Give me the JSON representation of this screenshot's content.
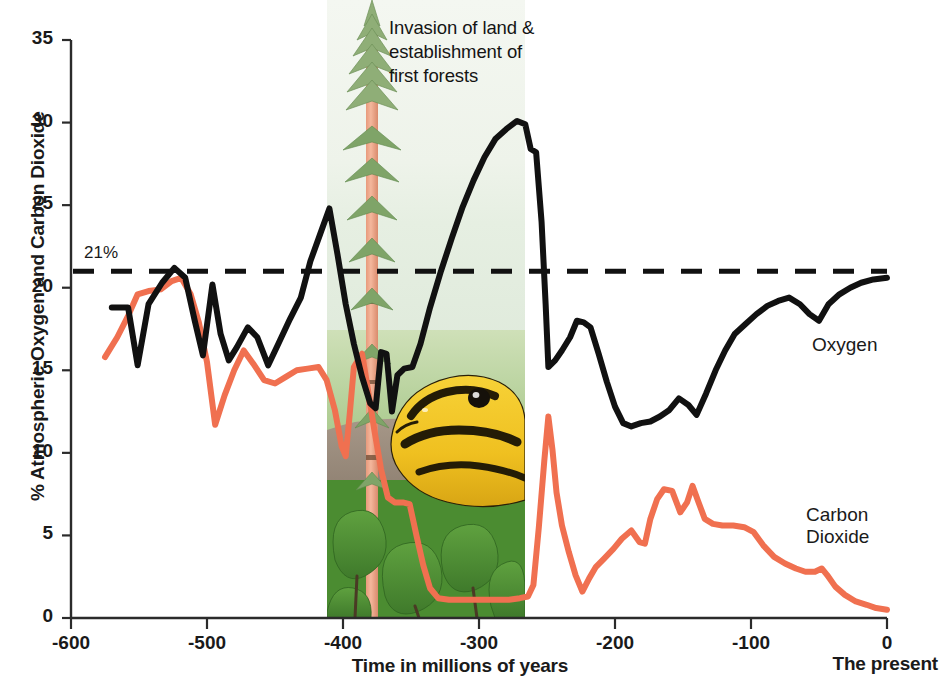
{
  "chart_data": {
    "type": "line",
    "title": "",
    "xlabel": "Time in millions of years",
    "ylabel": "% Atmospheric Oxygen and Carbon Dioxide",
    "xlim": [
      -600,
      0
    ],
    "ylim": [
      0,
      35
    ],
    "xticks": [
      -600,
      -500,
      -400,
      -300,
      -200,
      -100,
      0
    ],
    "xtick_labels": [
      "-600",
      "-500",
      "-400",
      "-300",
      "-200",
      "-100",
      "0"
    ],
    "yticks": [
      0,
      5,
      10,
      15,
      20,
      25,
      30,
      35
    ],
    "ytick_labels": [
      "0",
      "5",
      "10",
      "15",
      "20",
      "25",
      "30",
      "35"
    ],
    "grid": false,
    "legend_position": "inline-right",
    "x_axis_end_note": "The present",
    "threshold": {
      "label": "21%",
      "value": 21,
      "style": "dashed",
      "color": "#111111"
    },
    "annotations": [
      {
        "text": "Invasion of land & establishment of first forests",
        "x": -370,
        "y": 34
      }
    ],
    "series": [
      {
        "name": "Oxygen",
        "color": "#111111",
        "label": "Oxygen",
        "points": [
          [
            -570,
            18.8
          ],
          [
            -558,
            18.8
          ],
          [
            -551,
            15.3
          ],
          [
            -543,
            19.0
          ],
          [
            -533,
            20.3
          ],
          [
            -524,
            21.2
          ],
          [
            -516,
            20.6
          ],
          [
            -509,
            18.0
          ],
          [
            -503,
            15.9
          ],
          [
            -496,
            20.2
          ],
          [
            -490,
            17.2
          ],
          [
            -484,
            15.6
          ],
          [
            -478,
            16.4
          ],
          [
            -470,
            17.6
          ],
          [
            -463,
            17.0
          ],
          [
            -455,
            15.3
          ],
          [
            -447,
            16.7
          ],
          [
            -439,
            18.1
          ],
          [
            -431,
            19.4
          ],
          [
            -424,
            21.6
          ],
          [
            -417,
            23.2
          ],
          [
            -410,
            24.8
          ],
          [
            -404,
            22.0
          ],
          [
            -398,
            19.0
          ],
          [
            -392,
            16.6
          ],
          [
            -386,
            14.6
          ],
          [
            -380,
            13.0
          ],
          [
            -376,
            12.7
          ],
          [
            -372,
            16.1
          ],
          [
            -368,
            16.0
          ],
          [
            -364,
            12.5
          ],
          [
            -360,
            14.7
          ],
          [
            -355,
            15.1
          ],
          [
            -349,
            15.2
          ],
          [
            -343,
            16.6
          ],
          [
            -336,
            18.8
          ],
          [
            -328,
            21.0
          ],
          [
            -320,
            23.0
          ],
          [
            -312,
            24.9
          ],
          [
            -304,
            26.5
          ],
          [
            -296,
            27.9
          ],
          [
            -288,
            29.0
          ],
          [
            -280,
            29.6
          ],
          [
            -272,
            30.1
          ],
          [
            -266,
            29.9
          ],
          [
            -262,
            28.4
          ],
          [
            -258,
            28.2
          ],
          [
            -254,
            24.0
          ],
          [
            -251,
            19.0
          ],
          [
            -249,
            15.2
          ],
          [
            -244,
            15.6
          ],
          [
            -239,
            16.2
          ],
          [
            -233,
            17.0
          ],
          [
            -228,
            18.0
          ],
          [
            -223,
            17.9
          ],
          [
            -218,
            17.6
          ],
          [
            -212,
            16.0
          ],
          [
            -206,
            14.3
          ],
          [
            -200,
            12.8
          ],
          [
            -194,
            11.8
          ],
          [
            -188,
            11.6
          ],
          [
            -181,
            11.8
          ],
          [
            -174,
            11.9
          ],
          [
            -167,
            12.2
          ],
          [
            -160,
            12.6
          ],
          [
            -153,
            13.3
          ],
          [
            -146,
            12.9
          ],
          [
            -140,
            12.3
          ],
          [
            -133,
            13.6
          ],
          [
            -126,
            15.0
          ],
          [
            -119,
            16.2
          ],
          [
            -112,
            17.2
          ],
          [
            -104,
            17.8
          ],
          [
            -96,
            18.4
          ],
          [
            -88,
            18.9
          ],
          [
            -80,
            19.2
          ],
          [
            -72,
            19.4
          ],
          [
            -64,
            19.0
          ],
          [
            -57,
            18.4
          ],
          [
            -50,
            18.0
          ],
          [
            -43,
            19.0
          ],
          [
            -35,
            19.6
          ],
          [
            -27,
            20.0
          ],
          [
            -19,
            20.3
          ],
          [
            -10,
            20.5
          ],
          [
            0,
            20.6
          ]
        ]
      },
      {
        "name": "Carbon Dioxide",
        "color": "#F07050",
        "label": "Carbon Dioxide",
        "points": [
          [
            -575,
            15.8
          ],
          [
            -566,
            17.0
          ],
          [
            -558,
            18.3
          ],
          [
            -551,
            19.6
          ],
          [
            -543,
            19.8
          ],
          [
            -534,
            19.9
          ],
          [
            -526,
            20.4
          ],
          [
            -519,
            20.6
          ],
          [
            -512,
            19.6
          ],
          [
            -506,
            17.9
          ],
          [
            -500,
            15.5
          ],
          [
            -494,
            11.7
          ],
          [
            -487,
            13.5
          ],
          [
            -480,
            15.0
          ],
          [
            -473,
            16.2
          ],
          [
            -466,
            15.4
          ],
          [
            -458,
            14.4
          ],
          [
            -450,
            14.2
          ],
          [
            -442,
            14.6
          ],
          [
            -434,
            15.0
          ],
          [
            -426,
            15.1
          ],
          [
            -418,
            15.2
          ],
          [
            -412,
            14.4
          ],
          [
            -406,
            12.6
          ],
          [
            -401,
            10.4
          ],
          [
            -398,
            9.8
          ],
          [
            -395,
            12.4
          ],
          [
            -392,
            15.2
          ],
          [
            -389,
            15.6
          ],
          [
            -386,
            16.0
          ],
          [
            -382,
            14.0
          ],
          [
            -377,
            11.4
          ],
          [
            -372,
            9.0
          ],
          [
            -367,
            7.3
          ],
          [
            -362,
            7.0
          ],
          [
            -356,
            7.0
          ],
          [
            -351,
            6.9
          ],
          [
            -346,
            5.0
          ],
          [
            -341,
            3.2
          ],
          [
            -336,
            1.8
          ],
          [
            -330,
            1.2
          ],
          [
            -322,
            1.1
          ],
          [
            -312,
            1.1
          ],
          [
            -300,
            1.1
          ],
          [
            -288,
            1.1
          ],
          [
            -278,
            1.1
          ],
          [
            -270,
            1.2
          ],
          [
            -264,
            1.3
          ],
          [
            -260,
            2.0
          ],
          [
            -256,
            5.5
          ],
          [
            -252,
            9.5
          ],
          [
            -249,
            12.2
          ],
          [
            -246,
            10.2
          ],
          [
            -243,
            7.6
          ],
          [
            -239,
            5.6
          ],
          [
            -234,
            4.0
          ],
          [
            -229,
            2.6
          ],
          [
            -224,
            1.6
          ],
          [
            -219,
            2.4
          ],
          [
            -214,
            3.1
          ],
          [
            -208,
            3.6
          ],
          [
            -201,
            4.2
          ],
          [
            -195,
            4.8
          ],
          [
            -188,
            5.3
          ],
          [
            -182,
            4.6
          ],
          [
            -178,
            4.5
          ],
          [
            -174,
            6.0
          ],
          [
            -169,
            7.2
          ],
          [
            -164,
            7.8
          ],
          [
            -158,
            7.7
          ],
          [
            -152,
            6.4
          ],
          [
            -147,
            7.0
          ],
          [
            -143,
            8.0
          ],
          [
            -139,
            7.1
          ],
          [
            -134,
            6.0
          ],
          [
            -128,
            5.7
          ],
          [
            -121,
            5.6
          ],
          [
            -113,
            5.6
          ],
          [
            -105,
            5.5
          ],
          [
            -98,
            5.2
          ],
          [
            -91,
            4.4
          ],
          [
            -83,
            3.7
          ],
          [
            -75,
            3.3
          ],
          [
            -67,
            3.0
          ],
          [
            -60,
            2.8
          ],
          [
            -53,
            2.8
          ],
          [
            -48,
            3.0
          ],
          [
            -44,
            2.6
          ],
          [
            -38,
            1.9
          ],
          [
            -31,
            1.4
          ],
          [
            -23,
            1.0
          ],
          [
            -15,
            0.8
          ],
          [
            -8,
            0.6
          ],
          [
            0,
            0.5
          ]
        ]
      }
    ]
  },
  "axis": {
    "y_title": "% Atmospheric Oxygen and Carbon Dioxide",
    "x_title": "Time in millions of years",
    "present_note": "The present"
  },
  "illustration": {
    "caption": "Invasion of land & establishment of first forests",
    "alt_name": "horsetail-plant-and-salamander-illustration"
  }
}
